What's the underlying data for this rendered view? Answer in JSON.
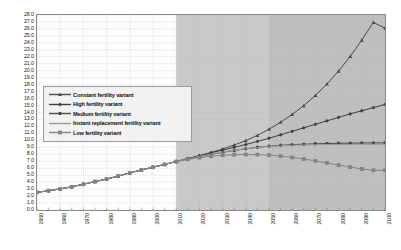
{
  "chart_data": {
    "type": "line",
    "title": "",
    "subtitle": "",
    "xlabel": "",
    "ylabel": "",
    "xlim": [
      1950,
      2100
    ],
    "ylim": [
      0.0,
      28.0
    ],
    "ytick_step": 1.0,
    "xtick_step": 10,
    "grid": true,
    "legend_position": "inside-upper-left",
    "categories": [
      1950,
      1955,
      1960,
      1965,
      1970,
      1975,
      1980,
      1985,
      1990,
      1995,
      2000,
      2005,
      2010,
      2015,
      2020,
      2025,
      2030,
      2035,
      2040,
      2045,
      2050,
      2055,
      2060,
      2065,
      2070,
      2075,
      2080,
      2085,
      2090,
      2095,
      2100
    ],
    "xtick_labels": [
      "1950",
      "1960",
      "1970",
      "1980",
      "1990",
      "2000",
      "2010",
      "2020",
      "2030",
      "2040",
      "2050",
      "2060",
      "2070",
      "2080",
      "2090",
      "2100"
    ],
    "ytick_labels": [
      "0.0",
      "1.0",
      "2.0",
      "3.0",
      "4.0",
      "5.0",
      "6.0",
      "7.0",
      "8.0",
      "9.0",
      "10.0",
      "11.0",
      "12.0",
      "13.0",
      "14.0",
      "15.0",
      "16.0",
      "17.0",
      "18.0",
      "19.0",
      "20.0",
      "21.0",
      "22.0",
      "23.0",
      "24.0",
      "25.0",
      "26.0",
      "27.0",
      "28.0"
    ],
    "shaded_bands": [
      {
        "from": 2010,
        "to": 2050,
        "color": "#c9c9c9"
      },
      {
        "from": 2050,
        "to": 2100,
        "color": "#bfbfbf"
      }
    ],
    "series": [
      {
        "name": "Constant fertility variant",
        "marker": "triangle",
        "color": "#4a4a4a",
        "values": [
          2.53,
          2.77,
          3.03,
          3.33,
          3.7,
          4.08,
          4.45,
          4.87,
          5.33,
          5.75,
          6.14,
          6.54,
          6.96,
          7.38,
          7.8,
          8.26,
          8.76,
          9.33,
          9.97,
          10.72,
          11.6,
          12.6,
          13.72,
          15.0,
          16.45,
          18.1,
          19.95,
          22.05,
          24.4,
          26.95,
          26.1
        ]
      },
      {
        "name": "High fertility variant",
        "marker": "diamond",
        "color": "#3d3d3d",
        "values": [
          2.53,
          2.77,
          3.03,
          3.33,
          3.7,
          4.08,
          4.45,
          4.87,
          5.33,
          5.75,
          6.14,
          6.54,
          6.96,
          7.38,
          7.8,
          8.2,
          8.6,
          9.0,
          9.4,
          9.85,
          10.3,
          10.8,
          11.3,
          11.8,
          12.3,
          12.8,
          13.3,
          13.8,
          14.25,
          14.7,
          15.15
        ]
      },
      {
        "name": "Medium fertility variant",
        "marker": "circle",
        "color": "#474747",
        "values": [
          2.53,
          2.77,
          3.03,
          3.33,
          3.7,
          4.08,
          4.45,
          4.87,
          5.33,
          5.75,
          6.14,
          6.54,
          6.96,
          7.32,
          7.66,
          7.98,
          8.28,
          8.55,
          8.8,
          9.0,
          9.15,
          9.28,
          9.38,
          9.45,
          9.5,
          9.55,
          9.58,
          9.6,
          9.62,
          9.63,
          9.64
        ]
      },
      {
        "name": "Instant replacement fertility variant",
        "marker": "none",
        "color": "#9b9b9b",
        "values": [
          2.53,
          2.77,
          3.03,
          3.33,
          3.7,
          4.08,
          4.45,
          4.87,
          5.33,
          5.75,
          6.14,
          6.54,
          6.96,
          7.34,
          7.7,
          8.02,
          8.32,
          8.58,
          8.8,
          8.98,
          9.12,
          9.22,
          9.3,
          9.35,
          9.38,
          9.4,
          9.41,
          9.42,
          9.42,
          9.43,
          9.43
        ]
      },
      {
        "name": "Low fertility variant",
        "marker": "square",
        "color": "#838383",
        "values": [
          2.53,
          2.77,
          3.03,
          3.33,
          3.7,
          4.08,
          4.45,
          4.87,
          5.33,
          5.75,
          6.14,
          6.54,
          6.96,
          7.26,
          7.52,
          7.72,
          7.86,
          7.94,
          7.96,
          7.94,
          7.88,
          7.74,
          7.55,
          7.32,
          7.05,
          6.76,
          6.46,
          6.16,
          5.9,
          5.7,
          5.7
        ]
      }
    ]
  },
  "legend": {
    "items": [
      {
        "label": "Constant fertility variant"
      },
      {
        "label": "High fertility variant"
      },
      {
        "label": "Medium fertility variant"
      },
      {
        "label": "Instant replacement fertility variant"
      },
      {
        "label": "Low fertility variant"
      }
    ]
  }
}
